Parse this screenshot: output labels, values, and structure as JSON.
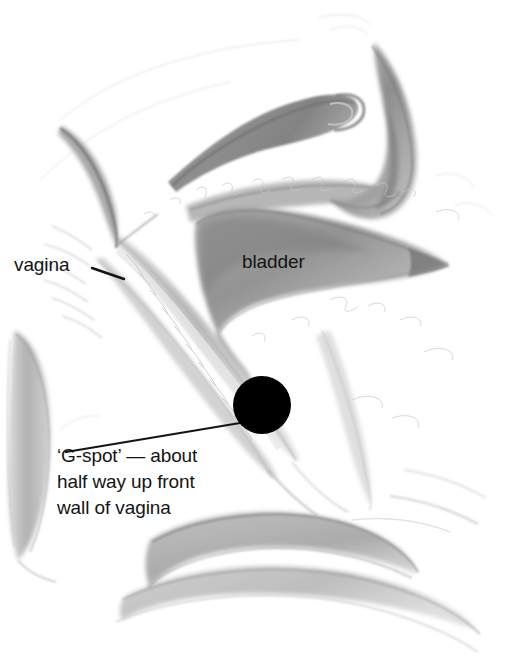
{
  "figure": {
    "medium": "pencil sketch",
    "background_color": "#ffffff",
    "ink_color": "#141414",
    "marker_color": "#000000",
    "width": 507,
    "height": 662
  },
  "labels": {
    "vagina": "vagina",
    "bladder": "bladder"
  },
  "caption": {
    "line1": "‘G-spot’ — about",
    "line2": "half way up front",
    "line3": "wall of vagina"
  },
  "marker": {
    "name": "g-spot-dot",
    "shape": "filled-circle",
    "center_x": 262,
    "center_y": 405,
    "radius": 29,
    "color": "#000000"
  },
  "leader_lines": [
    {
      "name": "vagina-leader",
      "from_x": 92,
      "from_y": 268,
      "to_x": 122,
      "to_y": 278
    },
    {
      "name": "gspot-leader",
      "from_x": 67,
      "from_y": 452,
      "to_x": 238,
      "to_y": 423
    }
  ],
  "structures": [
    {
      "name": "uterus-body",
      "tone": "#8f8f8f"
    },
    {
      "name": "uterus-fundus-crescent",
      "tone": "#8a8a8a"
    },
    {
      "name": "bladder-wedge",
      "tone": "#9a9a9a"
    },
    {
      "name": "vaginal-canal",
      "tone": "#b8b8b8"
    },
    {
      "name": "pubic-symphysis",
      "tone": "#b0b0b0"
    },
    {
      "name": "perineal-body",
      "tone": "#a8a8a8"
    },
    {
      "name": "rectum-outline",
      "tone": "#b4b4b4"
    },
    {
      "name": "pelvic-floor",
      "tone": "#a6a6a6"
    }
  ]
}
